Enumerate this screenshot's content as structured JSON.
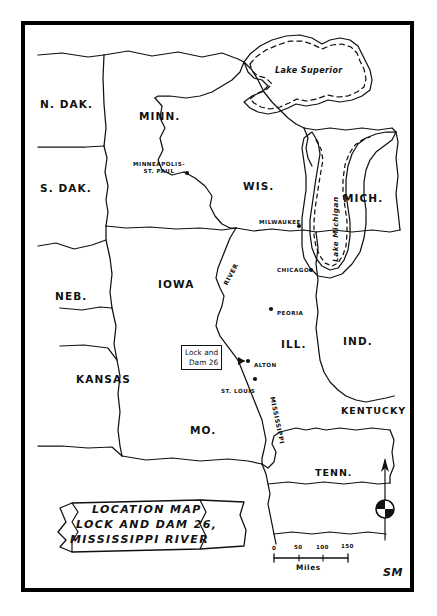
{
  "document": {
    "kind": "hand-drawn location map",
    "signature": "SM"
  },
  "title_block": {
    "line1": "LOCATION MAP",
    "line2": "LOCK AND DAM 26,",
    "line3": "MISSISSIPPI RIVER"
  },
  "callout": {
    "line1": "Lock and",
    "line2": "Dam 26"
  },
  "states": [
    {
      "id": "n-dak",
      "label": "N. DAK.",
      "x": 40,
      "y": 98,
      "size": "state"
    },
    {
      "id": "s-dak",
      "label": "S. DAK.",
      "x": 40,
      "y": 182,
      "size": "state"
    },
    {
      "id": "neb",
      "label": "NEB.",
      "x": 55,
      "y": 290,
      "size": "state"
    },
    {
      "id": "kansas",
      "label": "KANSAS",
      "x": 76,
      "y": 373,
      "size": "state"
    },
    {
      "id": "minn",
      "label": "MINN.",
      "x": 139,
      "y": 110,
      "size": "state"
    },
    {
      "id": "iowa",
      "label": "IOWA",
      "x": 158,
      "y": 278,
      "size": "state"
    },
    {
      "id": "mo",
      "label": "MO.",
      "x": 190,
      "y": 424,
      "size": "state"
    },
    {
      "id": "wis",
      "label": "WIS.",
      "x": 243,
      "y": 180,
      "size": "state"
    },
    {
      "id": "ill",
      "label": "ILL.",
      "x": 281,
      "y": 338,
      "size": "state"
    },
    {
      "id": "ind",
      "label": "IND.",
      "x": 343,
      "y": 335,
      "size": "state"
    },
    {
      "id": "mich",
      "label": "MICH.",
      "x": 343,
      "y": 192,
      "size": "state"
    },
    {
      "id": "kentucky",
      "label": "KENTUCKY",
      "x": 341,
      "y": 405,
      "size": "state-sm"
    },
    {
      "id": "tenn",
      "label": "TENN.",
      "x": 315,
      "y": 467,
      "size": "state-sm"
    }
  ],
  "cities": [
    {
      "id": "minneapolis-st-paul",
      "label": "MINNEAPOLIS-\nST. PAUL",
      "lx": 133,
      "ly": 161,
      "dx": 187,
      "dy": 173,
      "multiline": true
    },
    {
      "id": "milwaukee",
      "label": "MILWAUKEE",
      "lx": 259,
      "ly": 219,
      "dx": 299,
      "dy": 226,
      "multiline": false
    },
    {
      "id": "chicago",
      "label": "CHICAGO",
      "lx": 277,
      "ly": 267,
      "dx": 311,
      "dy": 270,
      "multiline": false
    },
    {
      "id": "peoria",
      "label": "PEORIA",
      "lx": 277,
      "ly": 310,
      "dx": 271,
      "dy": 309,
      "multiline": false
    },
    {
      "id": "alton",
      "label": "ALTON",
      "lx": 254,
      "ly": 362,
      "dx": 248,
      "dy": 361,
      "multiline": false
    },
    {
      "id": "st-louis",
      "label": "ST. LOUIS",
      "lx": 221,
      "ly": 388,
      "dx": 255,
      "dy": 379,
      "multiline": false
    }
  ],
  "water_labels": [
    {
      "id": "lake-superior",
      "label": "Lake Superior",
      "x": 275,
      "y": 72,
      "orientation": "horizontal"
    },
    {
      "id": "lake-michigan",
      "label": "Lake Michigan",
      "x": 328,
      "y": 262,
      "orientation": "vertical"
    },
    {
      "id": "river",
      "label": "RIVER",
      "x": 222,
      "y": 277,
      "orientation": "diagonal",
      "angle": -62
    },
    {
      "id": "mississippi",
      "label": "MISSISSIPPI",
      "x": 274,
      "y": 396,
      "orientation": "vertical-down",
      "angle": 78
    }
  ],
  "scale_bar": {
    "ticks": [
      "0",
      "50",
      "100",
      "150"
    ],
    "units": "Miles"
  },
  "compass": {
    "direction": "north-arrow"
  },
  "colors": {
    "ink": "#111111",
    "paper": "#ffffff",
    "frame": "#000000"
  }
}
